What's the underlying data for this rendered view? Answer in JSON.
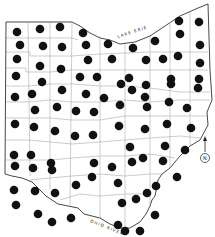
{
  "map": {
    "subject": "Ohio county map",
    "labels": {
      "lake": "LAKE ERIE",
      "river": "OHIO RIVER",
      "north": "N"
    },
    "colors": {
      "background": "#ffffff",
      "border": "#333333",
      "county_line": "#888888",
      "dot": "#111111"
    },
    "dot_radius": 4.3,
    "dots": [
      [
        17,
        32
      ],
      [
        40,
        29
      ],
      [
        60,
        27
      ],
      [
        20,
        45
      ],
      [
        43,
        46
      ],
      [
        62,
        47
      ],
      [
        17,
        59
      ],
      [
        40,
        66
      ],
      [
        61,
        69
      ],
      [
        16,
        76
      ],
      [
        83,
        33
      ],
      [
        86,
        45
      ],
      [
        108,
        44
      ],
      [
        133,
        48
      ],
      [
        88,
        60
      ],
      [
        112,
        59
      ],
      [
        80,
        77
      ],
      [
        97,
        77
      ],
      [
        129,
        78
      ],
      [
        179,
        21
      ],
      [
        199,
        22
      ],
      [
        180,
        34
      ],
      [
        155,
        41
      ],
      [
        200,
        45
      ],
      [
        146,
        60
      ],
      [
        163,
        59
      ],
      [
        178,
        56
      ],
      [
        200,
        63
      ],
      [
        171,
        79
      ],
      [
        199,
        79
      ],
      [
        15,
        97
      ],
      [
        32,
        94
      ],
      [
        42,
        82
      ],
      [
        62,
        90
      ],
      [
        35,
        110
      ],
      [
        57,
        107
      ],
      [
        15,
        124
      ],
      [
        34,
        127
      ],
      [
        55,
        131
      ],
      [
        14,
        155
      ],
      [
        31,
        155
      ],
      [
        51,
        163
      ],
      [
        86,
        94
      ],
      [
        104,
        98
      ],
      [
        121,
        84
      ],
      [
        132,
        90
      ],
      [
        76,
        111
      ],
      [
        94,
        112
      ],
      [
        120,
        105
      ],
      [
        147,
        107
      ],
      [
        75,
        136
      ],
      [
        93,
        135
      ],
      [
        119,
        126
      ],
      [
        130,
        147
      ],
      [
        94,
        163
      ],
      [
        112,
        167
      ],
      [
        132,
        162
      ],
      [
        146,
        85
      ],
      [
        171,
        84
      ],
      [
        198,
        88
      ],
      [
        145,
        97
      ],
      [
        169,
        102
      ],
      [
        187,
        108
      ],
      [
        145,
        129
      ],
      [
        167,
        124
      ],
      [
        191,
        128
      ],
      [
        165,
        146
      ],
      [
        185,
        150
      ],
      [
        143,
        158
      ],
      [
        163,
        161
      ],
      [
        177,
        177
      ],
      [
        15,
        166
      ],
      [
        33,
        168
      ],
      [
        52,
        170
      ],
      [
        14,
        190
      ],
      [
        35,
        191
      ],
      [
        55,
        193
      ],
      [
        16,
        205
      ],
      [
        38,
        214
      ],
      [
        52,
        222
      ],
      [
        71,
        218
      ],
      [
        76,
        185
      ],
      [
        92,
        177
      ],
      [
        118,
        183
      ],
      [
        122,
        203
      ],
      [
        136,
        199
      ],
      [
        147,
        193
      ],
      [
        118,
        225
      ],
      [
        140,
        231
      ],
      [
        155,
        215
      ],
      [
        156,
        186
      ],
      [
        125,
        231
      ]
    ],
    "north_arrow": {
      "x": 205,
      "y": 145
    }
  }
}
